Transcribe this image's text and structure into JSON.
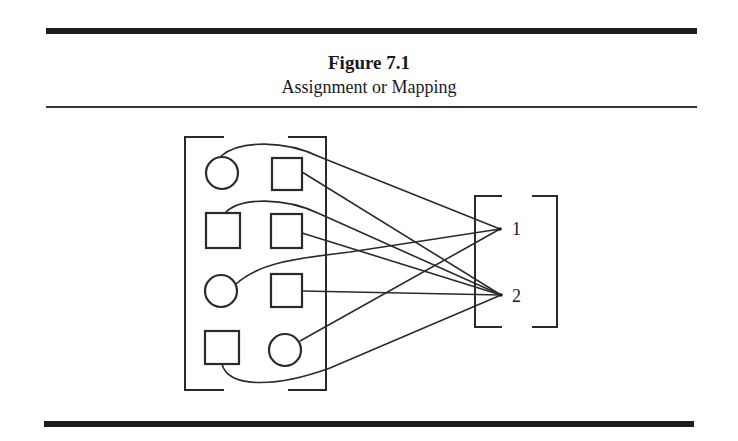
{
  "figure": {
    "title": "Figure 7.1",
    "subtitle": "Assignment or Mapping"
  },
  "diagram": {
    "domain_set": {
      "elements": [
        {
          "row": 1,
          "col": 1,
          "shape": "circle",
          "maps_to": "1"
        },
        {
          "row": 1,
          "col": 2,
          "shape": "square",
          "maps_to": "2"
        },
        {
          "row": 2,
          "col": 1,
          "shape": "square",
          "maps_to": "2"
        },
        {
          "row": 2,
          "col": 2,
          "shape": "square",
          "maps_to": "2"
        },
        {
          "row": 3,
          "col": 1,
          "shape": "circle",
          "maps_to": "1"
        },
        {
          "row": 3,
          "col": 2,
          "shape": "square",
          "maps_to": "2"
        },
        {
          "row": 4,
          "col": 1,
          "shape": "square",
          "maps_to": "2"
        },
        {
          "row": 4,
          "col": 2,
          "shape": "circle",
          "maps_to": "1"
        }
      ]
    },
    "target_set": {
      "labels": [
        "1",
        "2"
      ]
    }
  }
}
